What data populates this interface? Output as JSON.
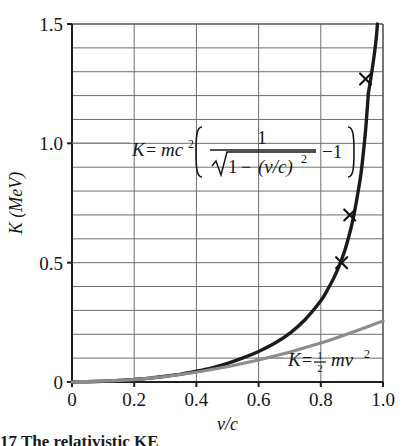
{
  "figure": {
    "title": "",
    "caption_fragment": "17  The relativistic KE"
  },
  "axes": {
    "x_title": "v/c",
    "y_title": "K (MeV)",
    "x_ticks": [
      "0",
      "0.2",
      "0.4",
      "0.6",
      "0.8",
      "1.0"
    ],
    "y_ticks": [
      "0",
      "0.5",
      "1.0",
      "1.5"
    ]
  },
  "annotations": {
    "relativistic": {
      "lead": "K",
      "equals": "=",
      "mc2_base": "mc",
      "mc2_exp": "2",
      "bracket_open": "[",
      "numerator": "1",
      "radical": "√",
      "denom_a": "1",
      "denom_minus": "−",
      "denom_b": "(v/c)",
      "denom_exp": "2",
      "minus_one": "−1",
      "bracket_close": "]"
    },
    "classical": {
      "lead": "K",
      "equals": "=",
      "frac_num": "1",
      "frac_den": "2",
      "body": "mv",
      "exp": "2"
    }
  },
  "chart_data": {
    "type": "line",
    "title": "",
    "xlabel": "v/c",
    "ylabel": "K (MeV)",
    "xlim": [
      0,
      1.0
    ],
    "ylim": [
      0,
      1.5
    ],
    "grid": true,
    "x_major_step": 0.2,
    "y_major_step": 0.5,
    "y_minor_step": 0.1,
    "legend_position": "inline-annotations",
    "series": [
      {
        "name": "K = mc^2 [ 1/sqrt(1-(v/c)^2) - 1 ]",
        "style": "relativistic",
        "color": "#1b1b1b",
        "width": 3.4,
        "x": [
          0.0,
          0.05,
          0.1,
          0.15,
          0.2,
          0.25,
          0.3,
          0.35,
          0.4,
          0.45,
          0.5,
          0.55,
          0.6,
          0.65,
          0.7,
          0.75,
          0.8,
          0.82,
          0.84,
          0.86,
          0.88,
          0.9,
          0.91,
          0.92,
          0.93,
          0.94,
          0.945,
          0.95,
          0.953
        ],
        "y": [
          0.0,
          0.001,
          0.003,
          0.006,
          0.011,
          0.016,
          0.024,
          0.033,
          0.045,
          0.059,
          0.078,
          0.101,
          0.128,
          0.161,
          0.204,
          0.262,
          0.34,
          0.383,
          0.431,
          0.49,
          0.563,
          0.661,
          0.724,
          0.798,
          0.881,
          1.0,
          1.07,
          1.155,
          1.21
        ]
      },
      {
        "name": "K = 1/2 mv^2",
        "style": "classical",
        "color": "#8c8c8c",
        "width": 3.2,
        "x": [
          0.0,
          0.2,
          0.4,
          0.6,
          0.8,
          1.0
        ],
        "y": [
          0.0,
          0.0102,
          0.0409,
          0.092,
          0.1635,
          0.2555
        ]
      }
    ],
    "markers": [
      {
        "label": "x-marker-1",
        "x": 0.867,
        "y": 0.5
      },
      {
        "label": "x-marker-2",
        "x": 0.893,
        "y": 0.7
      },
      {
        "label": "x-marker-3",
        "x": 0.944,
        "y": 1.27
      }
    ]
  }
}
